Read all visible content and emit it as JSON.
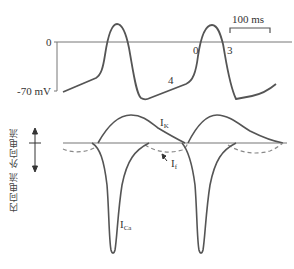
{
  "figure": {
    "top_panel": {
      "name": "membrane-potential",
      "zero_label": "0",
      "baseline_label": "-70 mV",
      "scale_bar_label": "100 ms",
      "phase_labels": {
        "phase0": "0",
        "phase3": "3",
        "phase4": "4"
      }
    },
    "bottom_panel": {
      "name": "ionic-currents",
      "axis_label_outward": "外向电流",
      "axis_label_inward": "内向电流",
      "axis_label_full": "内向电流 外向电流",
      "current_labels": {
        "ik": {
          "main": "I",
          "sub": "K"
        },
        "if": {
          "main": "I",
          "sub": "f"
        },
        "ica": {
          "main": "I",
          "sub": "Ca"
        }
      }
    },
    "colors": {
      "trace": "#555555",
      "axis": "#777777",
      "dashed": "#888888",
      "background": "#ffffff"
    }
  }
}
